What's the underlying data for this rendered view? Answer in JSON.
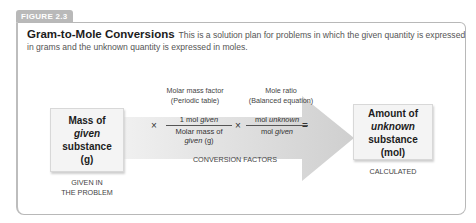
{
  "figure": {
    "label": "FIGURE 2.3",
    "title": "Gram-to-Mole Conversions",
    "description": "This is a solution plan for problems in which the given quantity is expressed in grams and the unknown quantity is expressed in moles."
  },
  "start_box": {
    "line1": "Mass of",
    "line2": "given",
    "line3": "substance",
    "line4": "(g)",
    "caption_line1": "GIVEN IN",
    "caption_line2": "THE PROBLEM"
  },
  "factor1": {
    "label_line1": "Molar mass factor",
    "label_line2": "(Periodic table)",
    "numerator_prefix": "1 mol ",
    "numerator_italic": "given",
    "denominator_line1": "Molar mass of",
    "denominator_italic": "given",
    "denominator_suffix": " (g)"
  },
  "factor2": {
    "label_line1": "Mole ratio",
    "label_line2": "(Balanced equation)",
    "numerator_prefix": "mol ",
    "numerator_italic": "unknown",
    "denominator_prefix": "mol ",
    "denominator_italic": "given"
  },
  "operators": {
    "times": "×",
    "equals": "="
  },
  "middle_caption": "CONVERSION FACTORS",
  "end_box": {
    "line1": "Amount of",
    "line2": "unknown",
    "line3": "substance",
    "line4": "(mol)",
    "caption": "CALCULATED"
  },
  "colors": {
    "arrow": "#d4d4d4",
    "badge": "#b9b9b9",
    "box_bg": "#f4f4f4"
  }
}
